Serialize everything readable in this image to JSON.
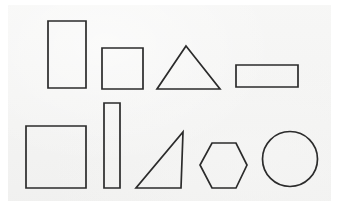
{
  "sheet": {
    "title": "Hand-drawn geometric shapes worksheet",
    "description": "A scanned off-white sheet of paper with nine outlined black geometric shapes arranged in two rows.",
    "background_color": "#ffffff",
    "paper_color": "#f2f2f1",
    "stroke_color": "#2b2b2b",
    "stroke_width": 1.7,
    "width": 339,
    "height": 206,
    "paper_bounds": {
      "x": 8,
      "y": 5,
      "width": 323,
      "height": 196
    }
  },
  "rows": [
    {
      "name": "top-row",
      "label": "Top row",
      "shape_count": 4
    },
    {
      "name": "bottom-row",
      "label": "Bottom row",
      "shape_count": 5
    }
  ],
  "shapes": [
    {
      "id": "tall-rectangle",
      "label": "Tall rectangle",
      "type": "rectangle",
      "row": "top-row",
      "index": 1,
      "x": 48,
      "y": 21,
      "width": 38,
      "height": 67,
      "points": "48,21 86,21 86,88 48,88"
    },
    {
      "id": "square-small",
      "label": "Small square",
      "type": "square",
      "row": "top-row",
      "index": 2,
      "x": 102,
      "y": 48,
      "width": 41,
      "height": 41,
      "points": "102,48 143,48 143,89 102,89"
    },
    {
      "id": "triangle-isosceles",
      "label": "Isosceles triangle",
      "type": "triangle",
      "row": "top-row",
      "index": 3,
      "x": 157,
      "y": 46,
      "width": 63,
      "height": 43,
      "points": "186,46 220,89 157,89"
    },
    {
      "id": "wide-rectangle",
      "label": "Wide rectangle",
      "type": "rectangle",
      "row": "top-row",
      "index": 4,
      "x": 236,
      "y": 65,
      "width": 62,
      "height": 22,
      "points": "236,65 298,65 298,87 236,87"
    },
    {
      "id": "square-large",
      "label": "Large square",
      "type": "square",
      "row": "bottom-row",
      "index": 1,
      "x": 26,
      "y": 126,
      "width": 60,
      "height": 62,
      "points": "26,126 86,126 86,188 26,188"
    },
    {
      "id": "narrow-rectangle",
      "label": "Narrow vertical rectangle",
      "type": "rectangle",
      "row": "bottom-row",
      "index": 2,
      "x": 104,
      "y": 103,
      "width": 16,
      "height": 85,
      "points": "104,103 120,103 120,188 104,188"
    },
    {
      "id": "triangle-right",
      "label": "Right triangle",
      "type": "triangle",
      "row": "bottom-row",
      "index": 3,
      "x": 136,
      "y": 132,
      "width": 47,
      "height": 56,
      "points": "183,132 181,188 136,188"
    },
    {
      "id": "hexagon",
      "label": "Hexagon",
      "type": "hexagon",
      "row": "bottom-row",
      "index": 4,
      "x": 200,
      "y": 143,
      "width": 47,
      "height": 45,
      "points": "212,143 236,143 247,165 236,188 212,188 200,165"
    },
    {
      "id": "circle",
      "label": "Circle",
      "type": "circle",
      "row": "bottom-row",
      "index": 5,
      "cx": 290,
      "cy": 159,
      "r": 27.5,
      "x": 263,
      "y": 131,
      "width": 55,
      "height": 55
    }
  ]
}
